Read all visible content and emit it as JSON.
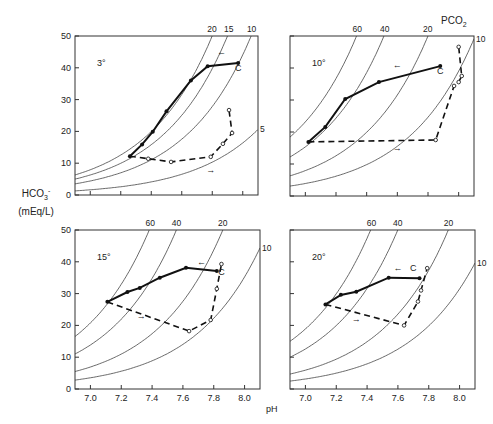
{
  "chart_data": [
    {
      "type": "line",
      "panel": "3°",
      "temperature_label": "3°",
      "xlabel": "pH",
      "ylabel": "HCO3- (mEq/L)",
      "xlim": [
        6.9,
        8.1
      ],
      "ylim": [
        0,
        50
      ],
      "yticks": [
        0,
        10,
        20,
        30,
        40,
        50
      ],
      "isopleth_label": "PCO2",
      "isopleths": [
        {
          "pco2": 20,
          "hco3_at_6_9": 6.3
        },
        {
          "pco2": 15,
          "hco3_at_6_9": 5.0
        },
        {
          "pco2": 10,
          "hco3_at_6_9": 3.5
        },
        {
          "pco2": 5,
          "hco3_at_6_9": 1.3
        }
      ],
      "series": [
        {
          "name": "recovery (solid, filled points)",
          "style": "solid",
          "points": [
            [
              7.26,
              12.2
            ],
            [
              7.34,
              15.9
            ],
            [
              7.41,
              19.9
            ],
            [
              7.5,
              26.3
            ],
            [
              7.66,
              36.0
            ],
            [
              7.77,
              40.5
            ],
            [
              7.97,
              41.5
            ]
          ]
        },
        {
          "name": "acidosis (dashed, open points)",
          "style": "dashed",
          "points": [
            [
              7.26,
              12.2
            ],
            [
              7.38,
              11.4
            ],
            [
              7.53,
              10.4
            ],
            [
              7.79,
              12.0
            ],
            [
              7.87,
              16.1
            ],
            [
              7.93,
              19.5
            ],
            [
              7.91,
              26.7
            ]
          ]
        }
      ],
      "annotations": [
        {
          "text": "C",
          "at": [
            7.97,
            39
          ]
        },
        {
          "text": "←",
          "at": [
            7.86,
            44
          ]
        },
        {
          "text": "→",
          "at": [
            7.79,
            7
          ]
        }
      ],
      "curve_labels": [
        "20",
        "15",
        "10",
        "5"
      ]
    },
    {
      "type": "line",
      "panel": "10°",
      "temperature_label": "10°",
      "xlabel": "pH",
      "ylabel": "HCO3- (mEq/L)",
      "xlim": [
        6.9,
        8.1
      ],
      "ylim": [
        0,
        50
      ],
      "isopleth_label": "PCO2",
      "isopleths": [
        {
          "pco2": 60,
          "hco3_at_6_9": 18.4
        },
        {
          "pco2": 40,
          "hco3_at_6_9": 12.2
        },
        {
          "pco2": 20,
          "hco3_at_6_9": 6.3
        },
        {
          "pco2": 10,
          "hco3_at_6_9": 3.1
        }
      ],
      "series": [
        {
          "name": "recovery (solid, filled points)",
          "style": "solid",
          "points": [
            [
              7.02,
              16.9
            ],
            [
              7.13,
              21.6
            ],
            [
              7.26,
              30.3
            ],
            [
              7.48,
              35.6
            ],
            [
              7.88,
              40.6
            ]
          ]
        },
        {
          "name": "acidosis (dashed, open points)",
          "style": "dashed",
          "points": [
            [
              7.02,
              16.9
            ],
            [
              7.85,
              17.5
            ],
            [
              7.97,
              34.4
            ],
            [
              8.0,
              35.6
            ],
            [
              8.02,
              37.5
            ],
            [
              8.0,
              46.6
            ]
          ]
        }
      ],
      "annotations": [
        {
          "text": "C",
          "at": [
            7.88,
            38
          ]
        },
        {
          "text": "←",
          "at": [
            7.6,
            40
          ]
        },
        {
          "text": "→",
          "at": [
            7.6,
            14
          ]
        }
      ],
      "curve_labels": [
        "60",
        "40",
        "20",
        "10"
      ]
    },
    {
      "type": "line",
      "panel": "15°",
      "temperature_label": "15°",
      "xlabel": "pH",
      "ylabel": "HCO3- (mEq/L)",
      "xlim": [
        6.9,
        8.1
      ],
      "ylim": [
        0,
        50
      ],
      "xticks": [
        7.0,
        7.2,
        7.4,
        7.6,
        7.8,
        8.0
      ],
      "yticks": [
        0,
        10,
        20,
        30,
        40,
        50
      ],
      "isopleth_label": "PCO2",
      "isopleths": [
        {
          "pco2": 60,
          "hco3_at_6_9": 16.5
        },
        {
          "pco2": 40,
          "hco3_at_6_9": 11.0
        },
        {
          "pco2": 20,
          "hco3_at_6_9": 5.5
        },
        {
          "pco2": 10,
          "hco3_at_6_9": 2.8
        }
      ],
      "series": [
        {
          "name": "recovery (solid, filled points)",
          "style": "solid",
          "points": [
            [
              7.11,
              27.4
            ],
            [
              7.24,
              30.5
            ],
            [
              7.32,
              31.8
            ],
            [
              7.45,
              35.0
            ],
            [
              7.62,
              38.1
            ],
            [
              7.82,
              37.1
            ]
          ]
        },
        {
          "name": "acidosis (dashed, open points)",
          "style": "dashed",
          "points": [
            [
              7.11,
              27.4
            ],
            [
              7.64,
              18.2
            ],
            [
              7.78,
              21.7
            ],
            [
              7.82,
              31.5
            ],
            [
              7.85,
              39.3
            ]
          ]
        }
      ],
      "annotations": [
        {
          "text": "C",
          "at": [
            7.85,
            36
          ]
        },
        {
          "text": "←",
          "at": [
            7.72,
            39
          ]
        },
        {
          "text": "→",
          "at": [
            7.33,
            22
          ]
        }
      ],
      "curve_labels": [
        "60",
        "40",
        "20"
      ]
    },
    {
      "type": "line",
      "panel": "20°",
      "temperature_label": "20°",
      "xlabel": "pH",
      "ylabel": "HCO3- (mEq/L)",
      "xlim": [
        6.9,
        8.1
      ],
      "ylim": [
        0,
        50
      ],
      "xticks": [
        7.0,
        7.2,
        7.4,
        7.6,
        7.8,
        8.0
      ],
      "isopleth_label": "PCO2",
      "isopleths": [
        {
          "pco2": 60,
          "hco3_at_6_9": 15.0
        },
        {
          "pco2": 40,
          "hco3_at_6_9": 10.0
        },
        {
          "pco2": 20,
          "hco3_at_6_9": 4.7
        },
        {
          "pco2": 10,
          "hco3_at_6_9": 2.5
        }
      ],
      "series": [
        {
          "name": "recovery (solid, filled points)",
          "style": "solid",
          "points": [
            [
              7.13,
              26.6
            ],
            [
              7.23,
              29.6
            ],
            [
              7.33,
              30.6
            ],
            [
              7.54,
              35.0
            ],
            [
              7.74,
              34.8
            ]
          ]
        },
        {
          "name": "acidosis (dashed, open points)",
          "style": "dashed",
          "points": [
            [
              7.13,
              26.6
            ],
            [
              7.64,
              20.0
            ],
            [
              7.73,
              27.5
            ],
            [
              7.75,
              31.0
            ],
            [
              7.79,
              38.0
            ]
          ]
        }
      ],
      "annotations": [
        {
          "text": "C",
          "at": [
            7.7,
            37
          ]
        },
        {
          "text": "←",
          "at": [
            7.6,
            37
          ]
        },
        {
          "text": "→",
          "at": [
            7.33,
            21
          ]
        }
      ],
      "curve_labels": [
        "60",
        "40",
        "20"
      ]
    }
  ],
  "labels": {
    "y_axis_line1": "HCO",
    "y_axis_sub": "3",
    "y_axis_sup": "-",
    "y_axis_line2": "(mEq/L)",
    "x_axis": "pH",
    "pco2": "PCO",
    "pco2_sub": "2"
  }
}
